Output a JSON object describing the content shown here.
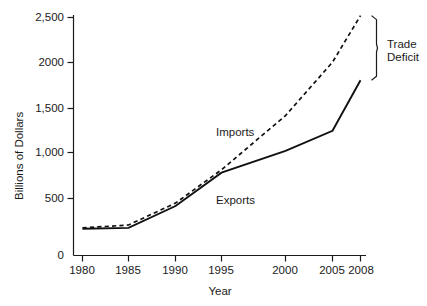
{
  "chart_data": {
    "type": "line",
    "title": "",
    "xlabel": "Year",
    "ylabel": "Billions of Dollars",
    "x": [
      1980,
      1985,
      1990,
      1995,
      2000,
      2005,
      2008
    ],
    "xtick_labels": [
      "1980",
      "1985",
      "1990",
      "1995",
      "2000",
      "2005",
      "2008"
    ],
    "ytick_labels": [
      "0",
      "500",
      "1,000",
      "1,500",
      "2000",
      "2,500"
    ],
    "ytick_values": [
      0,
      500,
      1000,
      1500,
      2000,
      2500
    ],
    "ylim": [
      0,
      2600
    ],
    "xlim": [
      1980,
      2008
    ],
    "grid": false,
    "legend_position": "inline-annotations",
    "series": [
      {
        "name": "Imports",
        "style": "dashed",
        "color": "#111111",
        "values": [
          290,
          320,
          550,
          900,
          1470,
          2030,
          2520
        ]
      },
      {
        "name": "Exports",
        "style": "solid",
        "color": "#111111",
        "values": [
          280,
          290,
          520,
          870,
          1100,
          1310,
          1840
        ]
      }
    ],
    "annotations": [
      {
        "name": "trade-deficit",
        "text_line1": "Trade",
        "text_line2": "Deficit",
        "spans_from": 1840,
        "spans_to": 2520,
        "at_x": 2008
      },
      {
        "name": "imports-label",
        "text": "Imports"
      },
      {
        "name": "exports-label",
        "text": "Exports"
      }
    ]
  },
  "labels": {
    "y_axis_title": "Billions of Dollars",
    "x_axis_title": "Year",
    "imports": "Imports",
    "exports": "Exports",
    "trade_deficit_line1": "Trade",
    "trade_deficit_line2": "Deficit"
  },
  "yticks": [
    {
      "label": "2,500",
      "value": 2500
    },
    {
      "label": "2000",
      "value": 2000
    },
    {
      "label": "1,500",
      "value": 1500
    },
    {
      "label": "1,000",
      "value": 1000
    },
    {
      "label": "500",
      "value": 500
    },
    {
      "label": "0",
      "value": 0
    }
  ],
  "xticks": [
    {
      "label": "1980",
      "value": 1980
    },
    {
      "label": "1985",
      "value": 1985
    },
    {
      "label": "1990",
      "value": 1990
    },
    {
      "label": "1995",
      "value": 1995
    },
    {
      "label": "2000",
      "value": 2000
    },
    {
      "label": "2005",
      "value": 2005
    },
    {
      "label": "2008",
      "value": 2008
    }
  ]
}
